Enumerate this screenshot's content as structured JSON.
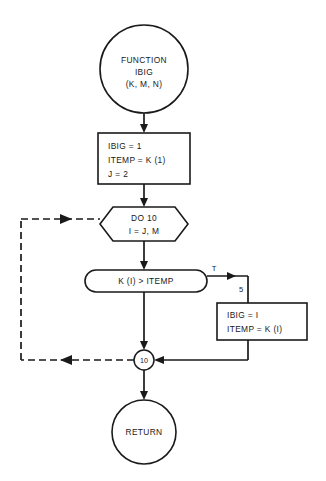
{
  "diagram": {
    "type": "program-flowchart",
    "colors": {
      "background": "#ffffff",
      "stroke": "#1a1a1a",
      "fill": "#ffffff"
    },
    "nodes": {
      "start": {
        "shape": "circle",
        "line1": "FUNCTION",
        "line2": "IBIG",
        "line3": "(K, M, N)"
      },
      "init_process": {
        "shape": "rectangle",
        "line1": "IBIG = 1",
        "line2": "ITEMP = K (1)",
        "line3": "J = 2"
      },
      "loop": {
        "shape": "hexagon",
        "line1": "DO 10",
        "line2": "I = J, M"
      },
      "decision": {
        "shape": "stadium",
        "line1": "K (I) > ITEMP"
      },
      "update_process": {
        "shape": "rectangle",
        "line1": "IBIG = I",
        "line2": "ITEMP = K (I)"
      },
      "junction": {
        "shape": "circle-small",
        "label": "10"
      },
      "end": {
        "shape": "circle",
        "label": "RETURN"
      }
    },
    "edge_labels": {
      "true_branch": "T",
      "statement_number": "5"
    }
  }
}
